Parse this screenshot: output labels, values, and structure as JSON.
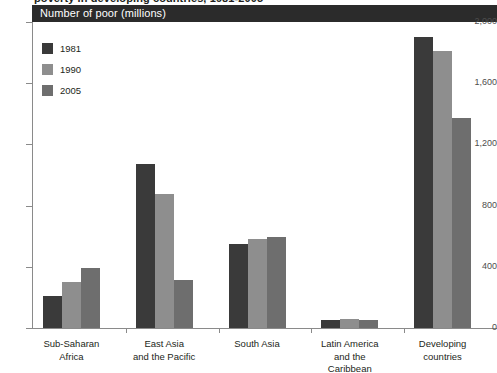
{
  "figure": {
    "clipped_title": "poverty in developing countries, 1981-2005",
    "header_label": "Number of poor (millions)"
  },
  "chart_data": {
    "type": "bar",
    "title": "Number of poor (millions)",
    "xlabel": "",
    "ylabel": "Number of poor (millions)",
    "ylim": [
      0,
      2000
    ],
    "ytick_labels": [
      "0",
      "400",
      "800",
      "1,200",
      "1,600",
      "2,000"
    ],
    "ytick_values": [
      0,
      400,
      800,
      1200,
      1600,
      2000
    ],
    "grid": false,
    "legend_position": "top-left-inside",
    "categories": [
      "Sub-Saharan\nAfrica",
      "East Asia\nand the Pacific",
      "South Asia",
      "Latin America\nand the\nCaribbean",
      "Developing\ncountries"
    ],
    "series": [
      {
        "name": "1981",
        "color": "#3a3a3a",
        "values": [
          212,
          1072,
          548,
          55,
          1900
        ]
      },
      {
        "name": "1990",
        "color": "#8e8e8e",
        "values": [
          298,
          873,
          579,
          60,
          1813
        ]
      },
      {
        "name": "2005",
        "color": "#6e6e6e",
        "values": [
          391,
          316,
          596,
          55,
          1374
        ]
      }
    ]
  }
}
